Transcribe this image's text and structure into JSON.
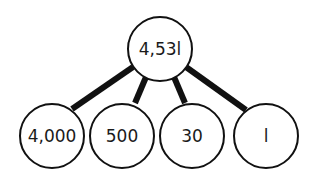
{
  "diagram": {
    "type": "place-value-decomposition-tree",
    "root": {
      "label": "4,531"
    },
    "children": [
      {
        "label": "4,000"
      },
      {
        "label": "500"
      },
      {
        "label": "30"
      },
      {
        "label": "1"
      }
    ],
    "display_children": [
      "4,000",
      "500",
      "30",
      "l"
    ],
    "root_display": "4,53l",
    "colors": {
      "stroke": "#111111",
      "fill": "#ffffff",
      "text": "#1a1a1a"
    }
  }
}
